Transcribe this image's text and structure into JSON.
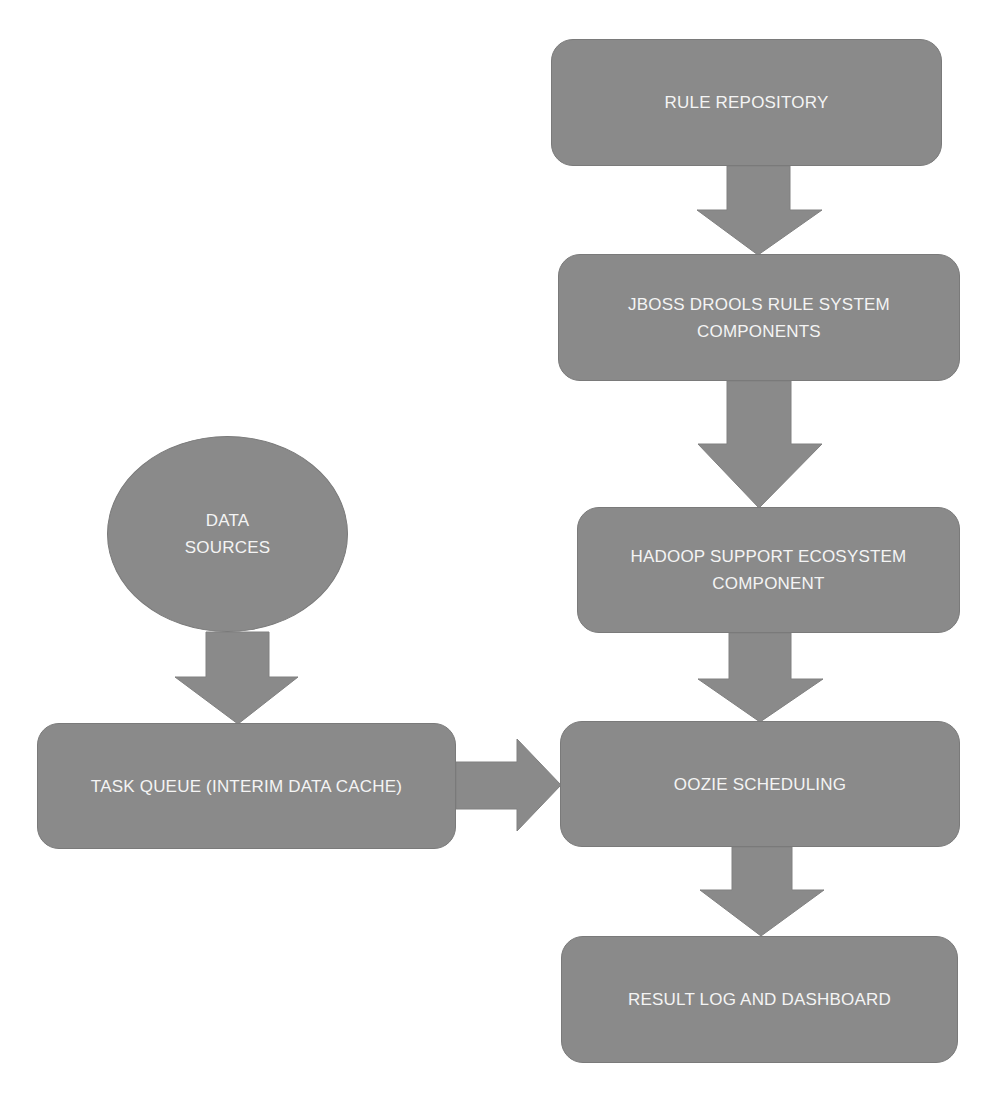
{
  "diagram": {
    "type": "flowchart",
    "fill_color": "#8a8a8a",
    "text_color": "#f4f4f4",
    "background": "#ffffff",
    "nodes": [
      {
        "id": "rule-repository",
        "shape": "rounded-rect",
        "label": "RULE REPOSITORY"
      },
      {
        "id": "jboss-drools",
        "shape": "rounded-rect",
        "label": "JBOSS DROOLS RULE SYSTEM\nCOMPONENTS"
      },
      {
        "id": "hadoop-support",
        "shape": "rounded-rect",
        "label": "HADOOP SUPPORT ECOSYSTEM\nCOMPONENT"
      },
      {
        "id": "oozie-scheduling",
        "shape": "rounded-rect",
        "label": "OOZIE SCHEDULING"
      },
      {
        "id": "result-log",
        "shape": "rounded-rect",
        "label": "RESULT LOG AND DASHBOARD"
      },
      {
        "id": "data-sources",
        "shape": "ellipse",
        "label": "DATA\nSOURCES"
      },
      {
        "id": "task-queue",
        "shape": "rounded-rect",
        "label": "TASK QUEUE (INTERIM DATA CACHE)"
      }
    ],
    "edges": [
      {
        "from": "rule-repository",
        "to": "jboss-drools",
        "direction": "down"
      },
      {
        "from": "jboss-drools",
        "to": "hadoop-support",
        "direction": "down"
      },
      {
        "from": "hadoop-support",
        "to": "oozie-scheduling",
        "direction": "down"
      },
      {
        "from": "oozie-scheduling",
        "to": "result-log",
        "direction": "down"
      },
      {
        "from": "data-sources",
        "to": "task-queue",
        "direction": "down"
      },
      {
        "from": "task-queue",
        "to": "oozie-scheduling",
        "direction": "right"
      }
    ]
  }
}
